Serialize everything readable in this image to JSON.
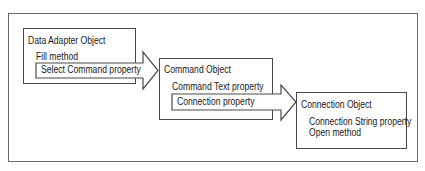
{
  "diagram": {
    "objects": [
      {
        "id": "data-adapter",
        "title": "Data Adapter Object",
        "members": [
          "Fill method"
        ],
        "outgoing_property": "Select Command property"
      },
      {
        "id": "command",
        "title": "Command Object",
        "members": [
          "Command Text property"
        ],
        "outgoing_property": "Connection property"
      },
      {
        "id": "connection",
        "title": "Connection Object",
        "members": [
          "Connection String property",
          "Open method"
        ]
      }
    ],
    "arrows": [
      {
        "from": "data-adapter",
        "to": "command",
        "label": "Select Command property"
      },
      {
        "from": "command",
        "to": "connection",
        "label": "Connection property"
      }
    ],
    "colors": {
      "border": "#4a4a4a",
      "outer_border": "#6a6a6a",
      "background": "#ffffff",
      "text": "#1a1a1a"
    }
  }
}
